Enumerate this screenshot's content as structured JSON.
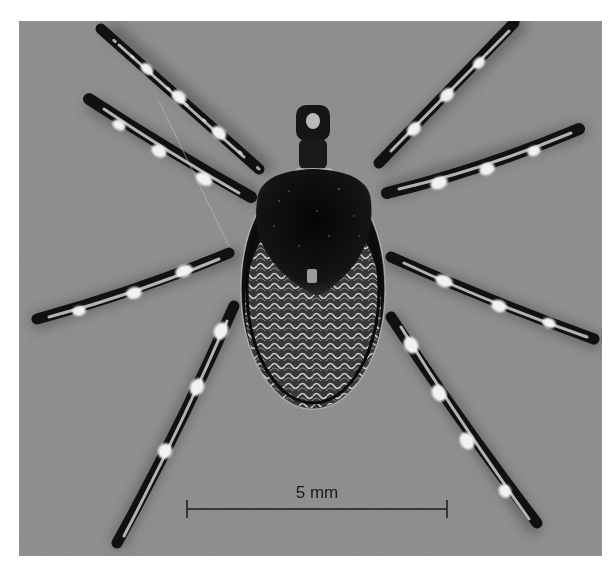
{
  "figure": {
    "background_color": "#8a8a8a",
    "scale_bar": {
      "label": "5 mm",
      "x1": 168,
      "x2": 428,
      "y": 488,
      "color": "#1a1a1a"
    }
  }
}
